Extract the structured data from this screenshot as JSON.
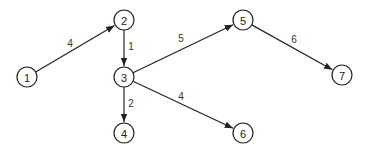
{
  "diagram": {
    "type": "directed-weighted-graph",
    "nodes": [
      {
        "id": "1",
        "label": "1",
        "x": 27,
        "y": 77
      },
      {
        "id": "2",
        "label": "2",
        "x": 124,
        "y": 20
      },
      {
        "id": "3",
        "label": "3",
        "x": 124,
        "y": 77
      },
      {
        "id": "4",
        "label": "4",
        "x": 124,
        "y": 133
      },
      {
        "id": "5",
        "label": "5",
        "x": 243,
        "y": 20
      },
      {
        "id": "6",
        "label": "6",
        "x": 243,
        "y": 133
      },
      {
        "id": "7",
        "label": "7",
        "x": 342,
        "y": 75
      }
    ],
    "edges": [
      {
        "from": "1",
        "to": "2",
        "weight": "4",
        "lx": 70,
        "ly": 43
      },
      {
        "from": "2",
        "to": "3",
        "weight": "1",
        "lx": 131,
        "ly": 46
      },
      {
        "from": "3",
        "to": "5",
        "weight": "5",
        "lx": 181,
        "ly": 38
      },
      {
        "from": "3",
        "to": "4",
        "weight": "2",
        "lx": 131,
        "ly": 103
      },
      {
        "from": "3",
        "to": "6",
        "weight": "4",
        "lx": 181,
        "ly": 96
      },
      {
        "from": "5",
        "to": "7",
        "weight": "6",
        "lx": 294,
        "ly": 39
      }
    ]
  }
}
